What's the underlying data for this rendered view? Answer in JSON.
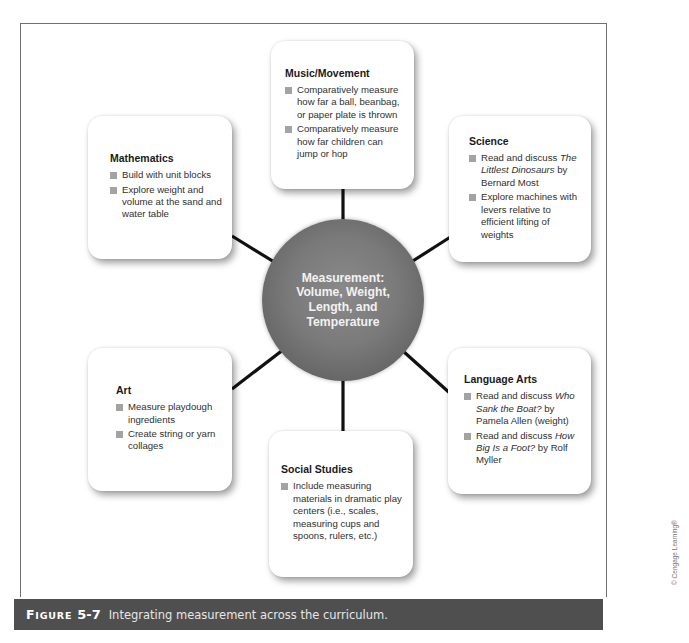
{
  "hub": {
    "label": "Measurement: Volume, Weight, Length, and Temperature"
  },
  "cards": {
    "music": {
      "title": "Music/Movement",
      "items": [
        "Comparatively measure how far a ball, beanbag, or paper plate is thrown",
        "Comparatively measure how far children can jump or hop"
      ]
    },
    "mathematics": {
      "title": "Mathematics",
      "items": [
        "Build with unit blocks",
        "Explore weight and volume at the sand and water table"
      ]
    },
    "science": {
      "title": "Science",
      "items": [
        {
          "pre": "Read and discuss ",
          "italic": "The Littlest Dinosaurs",
          "post": " by Bernard Most"
        },
        "Explore machines with levers relative to efficient lifting of weights"
      ]
    },
    "art": {
      "title": "Art",
      "items": [
        "Measure playdough ingredients",
        "Create string or yarn collages"
      ]
    },
    "language_arts": {
      "title": "Language Arts",
      "items": [
        {
          "pre": "Read and discuss ",
          "italic": "Who Sank the Boat?",
          "post": " by Pamela Allen (weight)"
        },
        {
          "pre": "Read and discuss ",
          "italic": "How Big Is a Foot?",
          "post": " by Rolf Myller"
        }
      ]
    },
    "social_studies": {
      "title": "Social Studies",
      "items": [
        "Include measuring materials in dramatic play centers (i.e., scales, measuring cups and spoons, rulers, etc.)"
      ]
    }
  },
  "caption": {
    "label_first": "F",
    "label_rest": "IGURE",
    "number": "5-7",
    "text": "Integrating measurement across the curriculum."
  },
  "credit": "© Cengage Learning®",
  "colors": {
    "caption_bar": "#4f4f4f",
    "hub": "#7a7a7a",
    "bullet": "#a3a3a3",
    "connector": "#111111"
  }
}
